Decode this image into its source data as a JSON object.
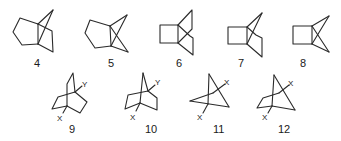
{
  "figure": {
    "row1": [
      {
        "id": "4",
        "label": "4"
      },
      {
        "id": "5",
        "label": "5"
      },
      {
        "id": "6",
        "label": "6"
      },
      {
        "id": "7",
        "label": "7"
      },
      {
        "id": "8",
        "label": "8"
      }
    ],
    "row2": [
      {
        "id": "9",
        "label": "9",
        "sub_top": "Y",
        "sub_bottom": "X"
      },
      {
        "id": "10",
        "label": "10",
        "sub_top": "Y",
        "sub_bottom": "X"
      },
      {
        "id": "11",
        "label": "11",
        "sub_top": "X",
        "sub_bottom": "X"
      },
      {
        "id": "12",
        "label": "12",
        "sub_top": "X",
        "sub_bottom": "X"
      }
    ]
  }
}
